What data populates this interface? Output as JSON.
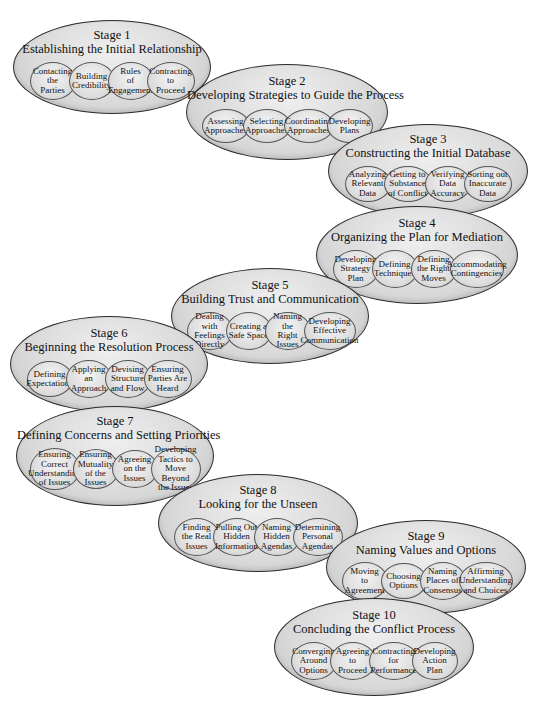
{
  "diagram": {
    "type": "process-stages",
    "stages": [
      {
        "number": "Stage 1",
        "title": "Establishing the Initial Relationship",
        "steps": [
          "Contacting\nthe\nParties",
          "Building\nCredibility",
          "Rules\nof\nEngagement",
          "Contracting\nto\nProceed"
        ]
      },
      {
        "number": "Stage 2",
        "title": "Developing Strategies to Guide the Process",
        "steps": [
          "Assessing\nApproaches",
          "Selecting\nApproaches",
          "Coordinating\nApproaches",
          "Developing\nPlans"
        ]
      },
      {
        "number": "Stage 3",
        "title": "Constructing the Initial Database",
        "steps": [
          "Analyzing\nRelevant\nData",
          "Getting to\nSubstance\nof Conflict",
          "Verifying\nData\nAccuracy",
          "Sorting out\nInaccurate\nData"
        ]
      },
      {
        "number": "Stage 4",
        "title": "Organizing the Plan for Mediation",
        "steps": [
          "Developing\nStrategy\nPlan",
          "Defining\nTechniques",
          "Defining\nthe Right\nMoves",
          "Accommodating\nContingencies"
        ]
      },
      {
        "number": "Stage 5",
        "title": "Building Trust and Communication",
        "steps": [
          "Dealing with\nFeelings\nDirectly",
          "Creating a\nSafe Space",
          "Naming the\nRight Issues",
          "Developing\nEffective\nCommunication"
        ]
      },
      {
        "number": "Stage 6",
        "title": "Beginning the Resolution Process",
        "steps": [
          "Defining\nExpectations",
          "Applying\nan\nApproach",
          "Devising\nStructure\nand Flow",
          "Ensuring\nParties Are\nHeard"
        ]
      },
      {
        "number": "Stage 7",
        "title": "Defining Concerns and Setting Priorities",
        "steps": [
          "Ensuring\nCorrect\nUnderstanding\nof Issues",
          "Ensuring\nMutuality\nof the Issues",
          "Agreeing\non the Issues",
          "Developing\nTactics to\nMove Beyond\nthe Issues"
        ]
      },
      {
        "number": "Stage 8",
        "title": "Looking for the Unseen",
        "steps": [
          "Finding\nthe Real\nIssues",
          "Pulling Out\nHidden\nInformation",
          "Naming\nHidden\nAgendas",
          "Determining\nPersonal\nAgendas"
        ]
      },
      {
        "number": "Stage 9",
        "title": "Naming Values and Options",
        "steps": [
          "Moving\nto\nAgreement",
          "Choosing\nOptions",
          "Naming\nPlaces of\nConsensus",
          "Affirming\nUnderstanding\nand Choices"
        ]
      },
      {
        "number": "Stage 10",
        "title": "Concluding the Conflict Process",
        "steps": [
          "Converging\nAround\nOptions",
          "Agreeing\nto\nProceed",
          "Contracting\nfor\nPerformance",
          "Developing\nAction\nPlan"
        ]
      }
    ]
  }
}
